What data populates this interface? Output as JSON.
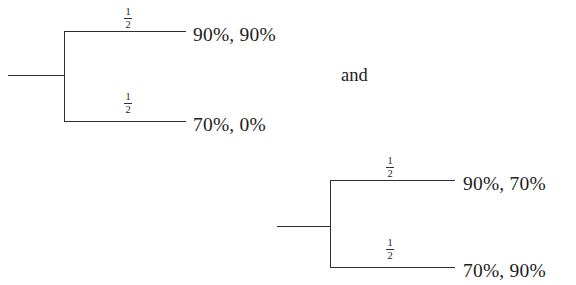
{
  "figure": {
    "type": "probability-tree-pair",
    "background": "#ffffff",
    "ink_color": "#2e2e33",
    "text_color": "#1d1d22",
    "connective": "and",
    "trees": [
      {
        "id": "tree-left",
        "branches": [
          {
            "id": "upper",
            "probability": "1",
            "probability_denominator": "2",
            "outcome": "90%, 90%"
          },
          {
            "id": "lower",
            "probability": "1",
            "probability_denominator": "2",
            "outcome": "70%, 0%"
          }
        ]
      },
      {
        "id": "tree-right",
        "branches": [
          {
            "id": "upper",
            "probability": "1",
            "probability_denominator": "2",
            "outcome": "90%, 70%"
          },
          {
            "id": "lower",
            "probability": "1",
            "probability_denominator": "2",
            "outcome": "70%, 90%"
          }
        ]
      }
    ]
  }
}
